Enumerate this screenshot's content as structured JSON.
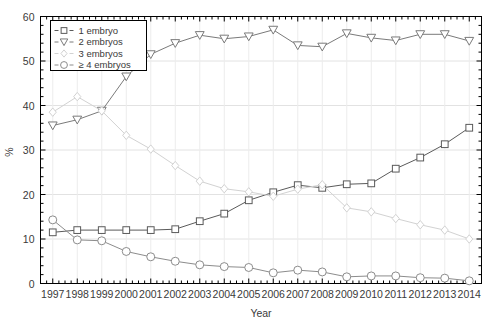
{
  "chart_data": {
    "type": "line",
    "title": "",
    "xlabel": "Year",
    "ylabel": "%",
    "xlim": [
      1996.5,
      2014.5
    ],
    "ylim": [
      0,
      60
    ],
    "xticks": [
      1997,
      1998,
      1999,
      2000,
      2001,
      2002,
      2003,
      2004,
      2005,
      2006,
      2007,
      2008,
      2009,
      2010,
      2011,
      2012,
      2013,
      2014
    ],
    "yticks": [
      0,
      10,
      20,
      30,
      40,
      50,
      60
    ],
    "grid": true,
    "legend_position": "upper left",
    "x": [
      1997,
      1998,
      1999,
      2000,
      2001,
      2002,
      2003,
      2004,
      2005,
      2006,
      2007,
      2008,
      2009,
      2010,
      2011,
      2012,
      2013,
      2014
    ],
    "series": [
      {
        "name": "1 embryo",
        "marker": "square",
        "color": "#5a5a5a",
        "values": [
          11.5,
          12.0,
          12.0,
          12.0,
          12.0,
          12.2,
          14.0,
          15.7,
          18.7,
          20.5,
          22.1,
          21.5,
          22.3,
          22.5,
          25.8,
          28.3,
          31.3,
          35.0
        ]
      },
      {
        "name": "2 embryos",
        "marker": "triangle-down",
        "color": "#7a7a7a",
        "values": [
          35.5,
          36.8,
          38.8,
          46.5,
          51.5,
          54.0,
          55.8,
          55.0,
          55.5,
          57.0,
          53.5,
          53.2,
          56.2,
          55.2,
          54.6,
          56.0,
          56.0,
          54.5
        ]
      },
      {
        "name": "3 embryos",
        "marker": "diamond",
        "color": "#d2d2d2",
        "values": [
          38.5,
          42.0,
          38.8,
          33.3,
          30.2,
          26.5,
          23.0,
          21.3,
          20.6,
          19.6,
          21.2,
          22.2,
          17.0,
          16.1,
          14.6,
          13.2,
          12.0,
          10.0
        ]
      },
      {
        "name": "≥ 4 embryos",
        "marker": "circle",
        "color": "#8c8c8c",
        "values": [
          14.3,
          9.8,
          9.6,
          7.2,
          6.0,
          5.0,
          4.2,
          3.8,
          3.6,
          2.4,
          3.0,
          2.6,
          1.5,
          1.7,
          1.7,
          1.3,
          1.2,
          0.6
        ]
      }
    ]
  },
  "legend": {
    "entries": [
      {
        "label": "1 embryo"
      },
      {
        "label": "2 embryos"
      },
      {
        "label": "3 embryos"
      },
      {
        "label": "≥ 4 embryos"
      }
    ]
  }
}
